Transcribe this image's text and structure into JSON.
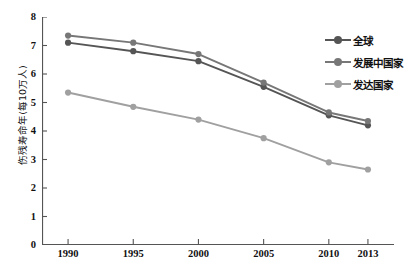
{
  "chart_data": {
    "type": "line",
    "title": "",
    "xlabel": "",
    "ylabel": "伤残寿命年(每10万人)",
    "categories": [
      "1990",
      "1995",
      "2000",
      "2005",
      "2010",
      "2013"
    ],
    "x": [
      1990,
      1995,
      2000,
      2005,
      2010,
      2013
    ],
    "xlim": [
      1988,
      2015
    ],
    "ylim": [
      0,
      8
    ],
    "y_ticks": [
      0,
      1,
      2,
      3,
      4,
      5,
      6,
      7,
      8
    ],
    "x_ticks": [
      "1990",
      "1995",
      "2000",
      "2005",
      "2010",
      "2013"
    ],
    "grid": false,
    "legend_position": "upper-right",
    "series": [
      {
        "name": "全球",
        "color": "#555555",
        "values": [
          7.1,
          6.8,
          6.45,
          5.55,
          4.55,
          4.2
        ]
      },
      {
        "name": "发展中国家",
        "color": "#777777",
        "values": [
          7.35,
          7.1,
          6.7,
          5.7,
          4.65,
          4.35
        ]
      },
      {
        "name": "发达国家",
        "color": "#a0a0a0",
        "values": [
          5.35,
          4.85,
          4.4,
          3.75,
          2.9,
          2.65
        ]
      }
    ]
  },
  "axis": {
    "line_color": "#555555",
    "tick_color": "#555555"
  },
  "legend": {
    "items": [
      {
        "label": "全球",
        "color": "#555555"
      },
      {
        "label": "发展中国家",
        "color": "#777777"
      },
      {
        "label": "发达国家",
        "color": "#a0a0a0"
      }
    ]
  }
}
